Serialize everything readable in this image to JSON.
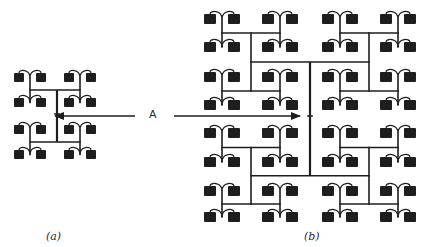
{
  "figure": {
    "arrow_label": "A",
    "captions": {
      "a": "(a)",
      "b": "(b)"
    }
  },
  "colors": {
    "ink": "#1e1e1e",
    "background": "#ffffff"
  },
  "diagram_a": {
    "description": "H-tree clock distribution, 16 cells",
    "pair_centers_x": [
      30,
      80
    ],
    "row_tops_y": [
      73,
      98,
      125,
      150
    ],
    "cell_size": [
      10,
      9
    ],
    "cell_offset": 9,
    "center": [
      57,
      114
    ]
  },
  "diagram_b": {
    "description": "H-tree clock distribution, 64 cells",
    "pair_centers_x": [
      222,
      280,
      340,
      398
    ],
    "row_tops_y": [
      14,
      42,
      72,
      100,
      128,
      157,
      186,
      212
    ],
    "cell_size": [
      12,
      10
    ],
    "cell_offset": 10,
    "center": [
      310,
      116
    ]
  },
  "arrows": [
    {
      "from": [
        135,
        116
      ],
      "to": [
        55,
        116
      ]
    },
    {
      "from": [
        174,
        116
      ],
      "to": [
        300,
        116
      ]
    }
  ]
}
